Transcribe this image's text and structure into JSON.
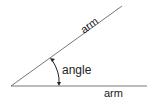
{
  "diagram": {
    "labels": {
      "upper_arm": "arm",
      "lower_arm": "arm",
      "angle": "angle"
    },
    "colors": {
      "line": "#777777",
      "text": "#222222"
    }
  }
}
